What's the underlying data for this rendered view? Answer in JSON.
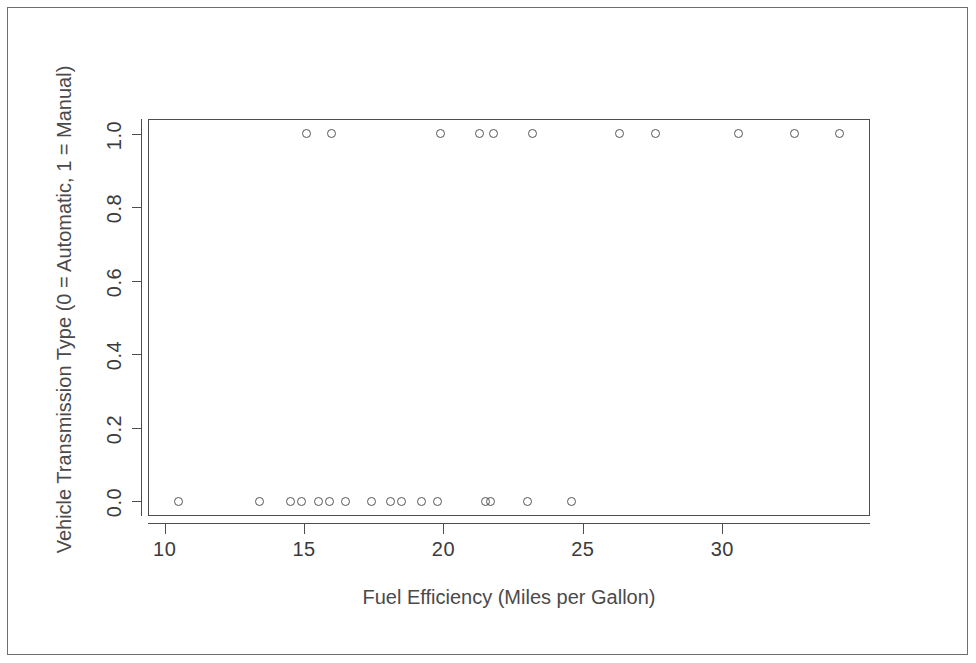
{
  "chart_data": {
    "type": "scatter",
    "title": "",
    "xlabel": "Fuel Efficiency (Miles per Gallon)",
    "ylabel": "Vehicle Transmission Type (0 = Automatic, 1 = Manual)",
    "xlim": [
      9.4,
      35.3
    ],
    "ylim": [
      -0.04,
      1.04
    ],
    "grid": false,
    "legend": null,
    "x_ticks": [
      "10",
      "15",
      "20",
      "25",
      "30"
    ],
    "x_tick_values": [
      10,
      15,
      20,
      25,
      30
    ],
    "y_ticks": [
      "0.0",
      "0.2",
      "0.4",
      "0.6",
      "0.8",
      "1.0"
    ],
    "y_tick_values": [
      0.0,
      0.2,
      0.4,
      0.6,
      0.8,
      1.0
    ],
    "marker": "open-circle",
    "marker_color": "#555555",
    "series": [
      {
        "name": "Automatic (0)",
        "y_value": 0,
        "x": [
          10.4,
          10.4,
          13.3,
          14.3,
          14.7,
          15.0,
          15.2,
          15.2,
          15.5,
          16.4,
          17.3,
          17.8,
          18.1,
          18.7,
          19.2,
          19.2,
          21.4,
          21.5,
          22.8,
          24.4
        ],
        "points": [
          {
            "x": 10.5,
            "y": 0
          },
          {
            "x": 13.4,
            "y": 0
          },
          {
            "x": 14.5,
            "y": 0
          },
          {
            "x": 14.9,
            "y": 0
          },
          {
            "x": 15.5,
            "y": 0
          },
          {
            "x": 15.9,
            "y": 0
          },
          {
            "x": 16.5,
            "y": 0
          },
          {
            "x": 17.4,
            "y": 0
          },
          {
            "x": 18.1,
            "y": 0
          },
          {
            "x": 18.5,
            "y": 0
          },
          {
            "x": 19.2,
            "y": 0
          },
          {
            "x": 19.8,
            "y": 0
          },
          {
            "x": 21.5,
            "y": 0
          },
          {
            "x": 21.7,
            "y": 0
          },
          {
            "x": 23.0,
            "y": 0
          },
          {
            "x": 24.6,
            "y": 0
          }
        ]
      },
      {
        "name": "Manual (1)",
        "y_value": 1,
        "x": [
          15.0,
          15.8,
          19.7,
          21.0,
          21.4,
          22.8,
          26.0,
          27.3,
          30.4,
          32.4,
          33.9
        ],
        "points": [
          {
            "x": 15.1,
            "y": 1
          },
          {
            "x": 16.0,
            "y": 1
          },
          {
            "x": 19.9,
            "y": 1
          },
          {
            "x": 21.3,
            "y": 1
          },
          {
            "x": 21.8,
            "y": 1
          },
          {
            "x": 23.2,
            "y": 1
          },
          {
            "x": 26.3,
            "y": 1
          },
          {
            "x": 27.6,
            "y": 1
          },
          {
            "x": 30.6,
            "y": 1
          },
          {
            "x": 32.6,
            "y": 1
          },
          {
            "x": 34.2,
            "y": 1
          }
        ]
      }
    ]
  },
  "colors": {
    "frame": "#6e6e6e",
    "axis": "#4d4d4d",
    "marker": "#555555",
    "text": "#3b3b3b",
    "background": "#ffffff"
  }
}
